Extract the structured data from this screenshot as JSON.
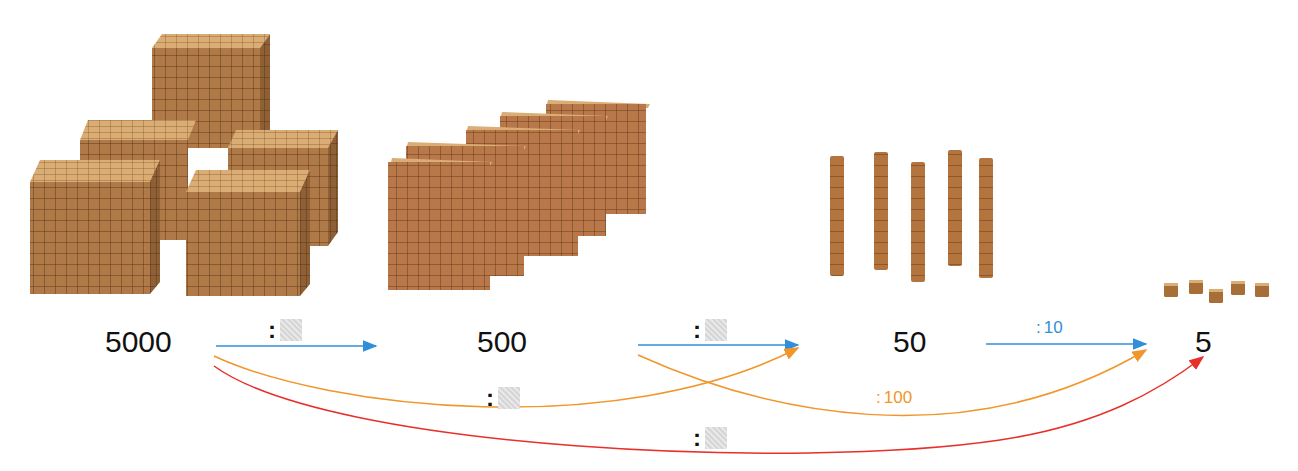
{
  "values": [
    {
      "label": "5000",
      "block": "thousand-cubes",
      "count": 5
    },
    {
      "label": "500",
      "block": "hundred-flats",
      "count": 5
    },
    {
      "label": "50",
      "block": "ten-rods",
      "count": 5
    },
    {
      "label": "5",
      "block": "unit-cubes",
      "count": 5
    }
  ],
  "arrows": [
    {
      "from": "5000",
      "to": "500",
      "operator": ":",
      "divisor": "",
      "color": "#2f8fd8",
      "blank": true
    },
    {
      "from": "500",
      "to": "50",
      "operator": ":",
      "divisor": "",
      "color": "#2f8fd8",
      "blank": true
    },
    {
      "from": "50",
      "to": "5",
      "operator": ":",
      "divisor": "10",
      "color": "#2f8fd8",
      "blank": false
    },
    {
      "from": "5000",
      "to": "50",
      "operator": ":",
      "divisor": "",
      "color": "#f0962a",
      "blank": true
    },
    {
      "from": "500",
      "to": "5",
      "operator": ":",
      "divisor": "100",
      "color": "#f0962a",
      "blank": false
    },
    {
      "from": "5000",
      "to": "5",
      "operator": ":",
      "divisor": "",
      "color": "#e8302a",
      "blank": true
    }
  ],
  "colors": {
    "blue": "#2f8fd8",
    "orange": "#f0962a",
    "red": "#e8302a",
    "wood": "#b07a48",
    "wood_dark": "#8a5a30",
    "wood_light": "#d4a26a"
  }
}
